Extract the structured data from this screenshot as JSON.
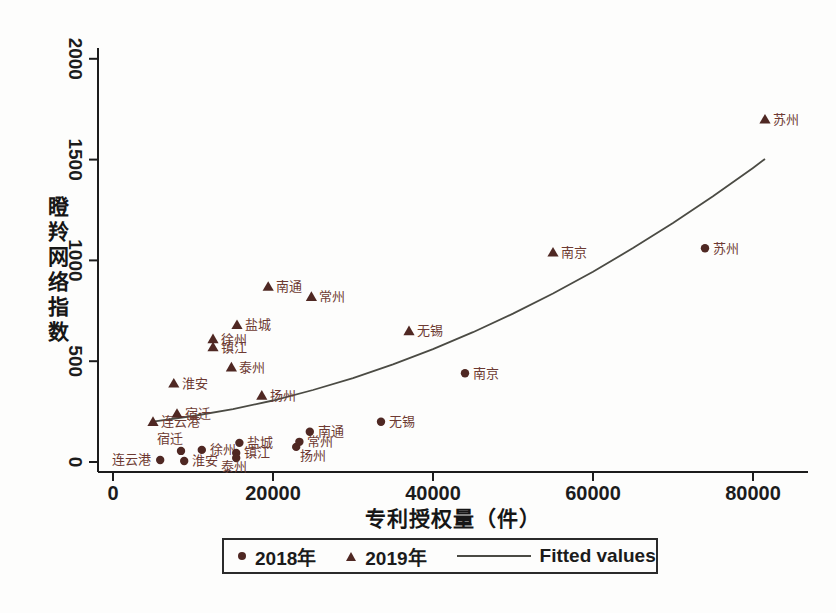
{
  "colors": {
    "marker": "#4f2823",
    "city_label": "#6d3a32",
    "fitted_line": "#4b4b44",
    "axis": "#1c1c1c",
    "background": "#fdfdfc"
  },
  "axes": {
    "x": {
      "title": "专利授权量（件）",
      "ticks": [
        {
          "label": "0",
          "value": 0
        },
        {
          "label": "20000",
          "value": 20000
        },
        {
          "label": "40000",
          "value": 40000
        },
        {
          "label": "60000",
          "value": 60000
        },
        {
          "label": "80000",
          "value": 80000
        }
      ]
    },
    "y": {
      "title": "瞪羚网络指数",
      "ticks": [
        {
          "label": "0",
          "value": 0
        },
        {
          "label": "500",
          "value": 500
        },
        {
          "label": "1000",
          "value": 1000
        },
        {
          "label": "1500",
          "value": 1500
        },
        {
          "label": "2000",
          "value": 2000
        }
      ]
    }
  },
  "legend": {
    "items": [
      {
        "marker": "dot",
        "label": "2018年"
      },
      {
        "marker": "triangle",
        "label": "2019年"
      },
      {
        "marker": "line",
        "label": "Fitted values"
      }
    ]
  },
  "chart_data": {
    "type": "scatter",
    "xlabel": "专利授权量（件）",
    "ylabel": "瞪羚网络指数",
    "xlim": [
      0,
      87500
    ],
    "ylim": [
      0,
      2070
    ],
    "grid": false,
    "legend_position": "bottom",
    "series": [
      {
        "name": "2018年",
        "marker": "circle",
        "points": [
          {
            "city": "连云港",
            "x": 5900,
            "y": 10,
            "lp": "l"
          },
          {
            "city": "宿迁",
            "x": 8500,
            "y": 55,
            "lp": "a"
          },
          {
            "city": "淮安",
            "x": 8900,
            "y": 5,
            "lp": "r"
          },
          {
            "city": "徐州",
            "x": 11100,
            "y": 60,
            "lp": "r"
          },
          {
            "city": "盐城",
            "x": 15800,
            "y": 95,
            "lp": "r"
          },
          {
            "city": "镇江",
            "x": 15400,
            "y": 45,
            "lp": "r"
          },
          {
            "city": "泰州",
            "x": 15400,
            "y": 20,
            "lp": "bl"
          },
          {
            "city": "扬州",
            "x": 22900,
            "y": 75,
            "lp": "br"
          },
          {
            "city": "常州",
            "x": 23300,
            "y": 100,
            "lp": "r"
          },
          {
            "city": "南通",
            "x": 24600,
            "y": 150,
            "lp": "r"
          },
          {
            "city": "无锡",
            "x": 33500,
            "y": 200,
            "lp": "r"
          },
          {
            "city": "南京",
            "x": 44000,
            "y": 440,
            "lp": "r"
          },
          {
            "city": "苏州",
            "x": 74000,
            "y": 1060,
            "lp": "r"
          }
        ]
      },
      {
        "name": "2019年",
        "marker": "triangle",
        "points": [
          {
            "city": "连云港",
            "x": 5000,
            "y": 200,
            "lp": "r"
          },
          {
            "city": "宿迁",
            "x": 8000,
            "y": 240,
            "lp": "r"
          },
          {
            "city": "淮安",
            "x": 7600,
            "y": 390,
            "lp": "r"
          },
          {
            "city": "徐州",
            "x": 12500,
            "y": 610,
            "lp": "r"
          },
          {
            "city": "镇江",
            "x": 12500,
            "y": 570,
            "lp": "r"
          },
          {
            "city": "泰州",
            "x": 14800,
            "y": 470,
            "lp": "r"
          },
          {
            "city": "盐城",
            "x": 15500,
            "y": 680,
            "lp": "r"
          },
          {
            "city": "扬州",
            "x": 18600,
            "y": 330,
            "lp": "r"
          },
          {
            "city": "南通",
            "x": 19400,
            "y": 870,
            "lp": "r"
          },
          {
            "city": "常州",
            "x": 24800,
            "y": 820,
            "lp": "r"
          },
          {
            "city": "无锡",
            "x": 37000,
            "y": 650,
            "lp": "r"
          },
          {
            "city": "南京",
            "x": 55000,
            "y": 1040,
            "lp": "r"
          },
          {
            "city": "苏州",
            "x": 81500,
            "y": 1700,
            "lp": "r"
          }
        ]
      },
      {
        "name": "Fitted values",
        "marker": "line",
        "points": [
          [
            5000,
            200
          ],
          [
            10000,
            228
          ],
          [
            15000,
            262
          ],
          [
            20000,
            305
          ],
          [
            25000,
            357
          ],
          [
            30000,
            416
          ],
          [
            35000,
            484
          ],
          [
            40000,
            560
          ],
          [
            45000,
            644
          ],
          [
            50000,
            736
          ],
          [
            55000,
            836
          ],
          [
            60000,
            944
          ],
          [
            65000,
            1061
          ],
          [
            70000,
            1186
          ],
          [
            75000,
            1318
          ],
          [
            80000,
            1459
          ],
          [
            81500,
            1503
          ]
        ]
      }
    ]
  }
}
